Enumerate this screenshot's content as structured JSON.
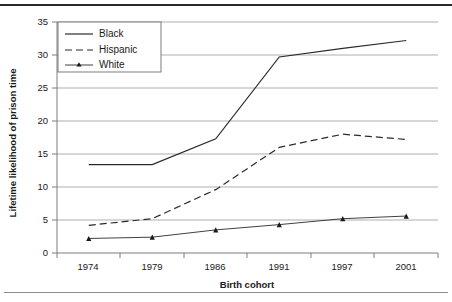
{
  "chart_data": {
    "type": "line",
    "title": "",
    "xlabel": "Birth cohort",
    "ylabel": "Lifetime likelihood of prison time",
    "categories": [
      "1974",
      "1979",
      "1986",
      "1991",
      "1997",
      "2001"
    ],
    "xlim": [
      0,
      5
    ],
    "ylim": [
      0,
      35
    ],
    "yticks": [
      "0",
      "5",
      "10",
      "15",
      "20",
      "25",
      "30",
      "35"
    ],
    "ytick_values": [
      0,
      5,
      10,
      15,
      20,
      25,
      30,
      35
    ],
    "grid": true,
    "legend_position": "top-left",
    "series": [
      {
        "name": "Black",
        "style": "solid",
        "marker": "none",
        "color": "#2a2a2a",
        "values": [
          13.4,
          13.4,
          17.3,
          29.7,
          31.0,
          32.2
        ]
      },
      {
        "name": "Hispanic",
        "style": "dashed",
        "marker": "none",
        "color": "#2a2a2a",
        "values": [
          4.2,
          5.2,
          9.6,
          16.0,
          18.0,
          17.2
        ]
      },
      {
        "name": "White",
        "style": "solid",
        "marker": "triangle",
        "color": "#2a2a2a",
        "values": [
          2.2,
          2.4,
          3.5,
          4.3,
          5.2,
          5.6
        ]
      }
    ]
  },
  "legend": {
    "items": [
      {
        "label": "Black"
      },
      {
        "label": "Hispanic"
      },
      {
        "label": "White"
      }
    ]
  },
  "axes": {
    "x_title": "Birth cohort",
    "y_title": "Lifetime likelihood of prison time",
    "x_tick_labels": [
      "1974",
      "1979",
      "1986",
      "1991",
      "1997",
      "2001"
    ],
    "y_tick_labels": [
      "35",
      "30",
      "25",
      "20",
      "15",
      "10",
      "5",
      "0"
    ]
  }
}
